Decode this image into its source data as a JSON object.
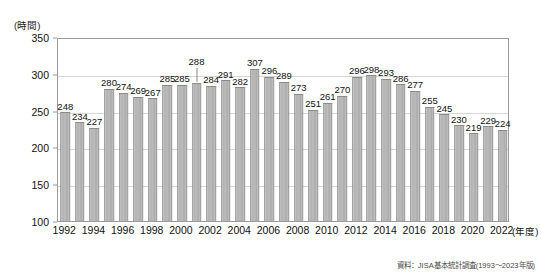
{
  "chart_data": {
    "type": "bar",
    "title": "",
    "xlabel": "(年度)",
    "ylabel": "(時間)",
    "ylim": [
      100,
      350
    ],
    "yticks": [
      100,
      150,
      200,
      250,
      300,
      350
    ],
    "grid": true,
    "legend": null,
    "categories": [
      "1992",
      "1993",
      "1994",
      "1995",
      "1996",
      "1997",
      "1998",
      "1999",
      "2000",
      "2001",
      "2002",
      "2003",
      "2004",
      "2005",
      "2006",
      "2007",
      "2008",
      "2009",
      "2010",
      "2011",
      "2012",
      "2013",
      "2014",
      "2015",
      "2016",
      "2017",
      "2018",
      "2019",
      "2020",
      "2021",
      "2022"
    ],
    "xtick_labels": [
      "1992",
      "1994",
      "1996",
      "1998",
      "2000",
      "2002",
      "2004",
      "2006",
      "2008",
      "2010",
      "2012",
      "2014",
      "2016",
      "2018",
      "2020",
      "2022"
    ],
    "values": [
      248,
      234,
      227,
      280,
      274,
      269,
      267,
      285,
      285,
      288,
      284,
      291,
      282,
      307,
      296,
      289,
      273,
      251,
      261,
      270,
      296,
      298,
      293,
      286,
      277,
      255,
      245,
      230,
      219,
      229,
      224
    ],
    "bar_color": "#b5b5b5",
    "bar_border_color": "#8f8f8f",
    "grid_color": "#d6d6d6",
    "frame_color": "#9b9b9b"
  },
  "annotations": {
    "source_note": "資料：JISA基本統計調査(1993〜2023年版)"
  }
}
